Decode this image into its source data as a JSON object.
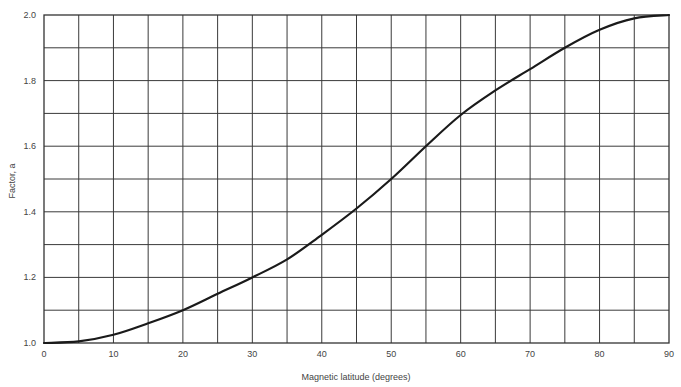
{
  "chart_data": {
    "type": "line",
    "title": "",
    "xlabel": "Magnetic latitude (degrees)",
    "ylabel": "Factor, a",
    "xlim": [
      0,
      90
    ],
    "ylim": [
      1.0,
      2.0
    ],
    "grid": true,
    "x_minor_step": 5,
    "y_minor_step": 0.1,
    "x_ticks": [
      0,
      10,
      20,
      30,
      40,
      50,
      60,
      70,
      80,
      90
    ],
    "x_tick_labels": [
      "0",
      "10",
      "20",
      "30",
      "40",
      "50",
      "60",
      "70",
      "80",
      "90"
    ],
    "y_ticks": [
      1.0,
      1.2,
      1.4,
      1.6,
      1.8,
      2.0
    ],
    "y_tick_labels": [
      "1.0",
      "1.2",
      "1.4",
      "1.6",
      "1.8",
      "2.0"
    ],
    "series": [
      {
        "name": "Factor a vs magnetic latitude",
        "x": [
          0,
          5,
          10,
          15,
          20,
          25,
          30,
          35,
          40,
          45,
          50,
          55,
          60,
          65,
          70,
          75,
          80,
          85,
          90
        ],
        "values": [
          1.0,
          1.005,
          1.025,
          1.06,
          1.1,
          1.15,
          1.2,
          1.255,
          1.33,
          1.41,
          1.5,
          1.6,
          1.695,
          1.77,
          1.835,
          1.9,
          1.955,
          1.99,
          2.0
        ]
      }
    ]
  }
}
